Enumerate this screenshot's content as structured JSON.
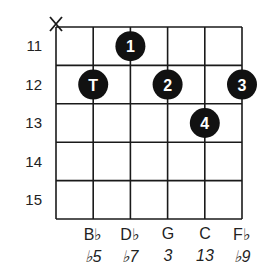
{
  "diagram": {
    "type": "guitar-chord-diagram",
    "muted_string_marker": "X",
    "muted_string_index": 0,
    "fret_numbers": [
      "11",
      "12",
      "13",
      "14",
      "15"
    ],
    "strings": 6,
    "frets_shown": 5,
    "dots": [
      {
        "label": "1",
        "string": 2,
        "fret": 0
      },
      {
        "label": "T",
        "string": 1,
        "fret": 1
      },
      {
        "label": "2",
        "string": 3,
        "fret": 1
      },
      {
        "label": "3",
        "string": 5,
        "fret": 1
      },
      {
        "label": "4",
        "string": 4,
        "fret": 2
      }
    ],
    "notes": [
      {
        "name": "B♭",
        "string": 1
      },
      {
        "name": "D♭",
        "string": 2
      },
      {
        "name": "G",
        "string": 3
      },
      {
        "name": "C",
        "string": 4
      },
      {
        "name": "F♭",
        "string": 5
      }
    ],
    "intervals": [
      {
        "label": "♭5",
        "string": 1
      },
      {
        "label": "♭7",
        "string": 2
      },
      {
        "label": "3",
        "string": 3
      },
      {
        "label": "13",
        "string": 4
      },
      {
        "label": "♭9",
        "string": 5
      }
    ],
    "colors": {
      "grid": "#1a1a1a",
      "dot_fill": "#111111",
      "dot_text": "#ffffff"
    }
  }
}
